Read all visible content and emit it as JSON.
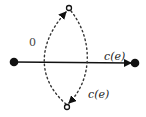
{
  "diagram": {
    "nodes": [
      {
        "id": "left",
        "type": "filled",
        "x": 14,
        "y": 62
      },
      {
        "id": "right",
        "type": "filled",
        "x": 135,
        "y": 63
      },
      {
        "id": "top",
        "type": "open",
        "x": 69,
        "y": 8
      },
      {
        "id": "bottom",
        "type": "open",
        "x": 67,
        "y": 107
      }
    ],
    "edges": [
      {
        "from": "left",
        "to": "right",
        "style": "solid",
        "arrow": true,
        "label": "c(e)"
      },
      {
        "from": "bottom",
        "to": "top",
        "style": "dotted",
        "arrow": true,
        "label": "0",
        "side": "left"
      },
      {
        "from": "top",
        "to": "bottom",
        "style": "dotted",
        "arrow": true,
        "label": "c(e)",
        "side": "right"
      }
    ],
    "labels": {
      "main_edge": "c(e)",
      "left_arc": "0",
      "right_arc": "c(e)"
    },
    "colors": {
      "stroke": "#111111",
      "dotted": "#333333",
      "background": "#ffffff"
    }
  }
}
